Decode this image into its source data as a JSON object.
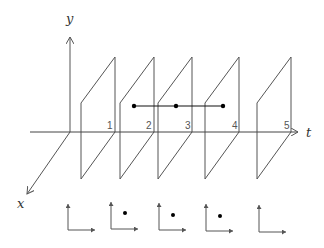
{
  "diagram": {
    "axes": {
      "y_label": "y",
      "x_label": "x",
      "t_label": "t"
    },
    "planes": [
      {
        "label": "1",
        "t": 1
      },
      {
        "label": "2",
        "t": 2
      },
      {
        "label": "3",
        "t": 3
      },
      {
        "label": "4",
        "t": 4
      },
      {
        "label": "5",
        "t": 5
      }
    ],
    "trajectory": {
      "points_on_planes": [
        2,
        3,
        4
      ],
      "description": "horizontal line segment connecting three dots"
    },
    "snapshots": [
      {
        "index": 1,
        "has_dot": false
      },
      {
        "index": 2,
        "has_dot": true
      },
      {
        "index": 3,
        "has_dot": true
      },
      {
        "index": 4,
        "has_dot": true
      },
      {
        "index": 5,
        "has_dot": false
      }
    ],
    "colors": {
      "line": "#555555",
      "dark_line": "#111111",
      "dot": "#000000"
    }
  }
}
